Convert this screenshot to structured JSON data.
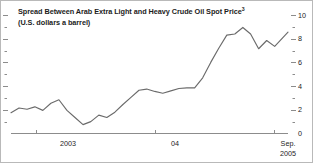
{
  "chart_data": {
    "type": "line",
    "title": "Spread Between Arab Extra Light and Heavy Crude Oil Spot Price",
    "title_superscript": "3",
    "subtitle": "(U.S. dollars a barrel)",
    "xlabel": "",
    "ylabel": "",
    "ylim": [
      0,
      10
    ],
    "y_major_ticks": [
      0,
      2,
      4,
      6,
      8,
      10
    ],
    "y_minor_ticks": [
      1,
      3,
      5,
      7,
      9
    ],
    "y_tick_labels": [
      "0",
      "2",
      "4",
      "6",
      "8",
      "10"
    ],
    "y_axis_position": "right",
    "grid": false,
    "legend": null,
    "line_color": "#6b6b6b",
    "axis_color": "#8c8c8c",
    "x_tick_labels": [
      "2003",
      "04",
      "Sep."
    ],
    "x_end_label_line2": "2005",
    "x_tick_positions": [
      0.09,
      0.52,
      0.95
    ],
    "x_axis_start_label": "2003",
    "series": [
      {
        "name": "Arab Extra Light minus Heavy spread",
        "x": [
          0.0,
          0.029,
          0.058,
          0.086,
          0.115,
          0.144,
          0.173,
          0.202,
          0.231,
          0.26,
          0.288,
          0.317,
          0.346,
          0.375,
          0.404,
          0.433,
          0.462,
          0.49,
          0.519,
          0.548,
          0.577,
          0.606,
          0.635,
          0.663,
          0.692,
          0.721,
          0.75,
          0.779,
          0.808,
          0.837,
          0.865,
          0.894,
          0.923,
          0.952,
          1.0
        ],
        "values": [
          1.75,
          2.15,
          2.05,
          2.25,
          1.95,
          2.55,
          2.85,
          1.95,
          1.35,
          0.75,
          1.0,
          1.55,
          1.35,
          1.8,
          2.45,
          3.05,
          3.65,
          3.75,
          3.55,
          3.4,
          3.6,
          3.8,
          3.85,
          3.85,
          4.7,
          6.0,
          7.2,
          8.3,
          8.4,
          8.95,
          8.4,
          7.15,
          7.85,
          7.35,
          8.55
        ]
      }
    ]
  },
  "axis": {
    "right_labels": [
      "10",
      "8",
      "6",
      "4",
      "2",
      "0"
    ],
    "bottom_labels": {
      "first": "2003",
      "middle": "04",
      "last_line1": "Sep.",
      "last_line2": "2005"
    }
  }
}
